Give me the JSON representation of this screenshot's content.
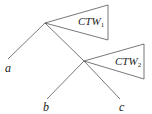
{
  "diagram": {
    "type": "tree",
    "nodes": [
      {
        "id": "root",
        "x": 45,
        "y": 23
      },
      {
        "id": "inner",
        "x": 84,
        "y": 61
      }
    ],
    "edges": [
      {
        "from": "root",
        "to": "a"
      },
      {
        "from": "root",
        "to": "inner"
      },
      {
        "from": "inner",
        "to": "b"
      },
      {
        "from": "inner",
        "to": "c"
      }
    ],
    "leaves": {
      "a": "a",
      "b": "b",
      "c": "c"
    },
    "subtrees": [
      {
        "label": "CTW",
        "subscript": "1",
        "attached_to": "root"
      },
      {
        "label": "CTW",
        "subscript": "2",
        "attached_to": "inner"
      }
    ],
    "colors": {
      "line": "#555555",
      "text": "#222222"
    }
  }
}
